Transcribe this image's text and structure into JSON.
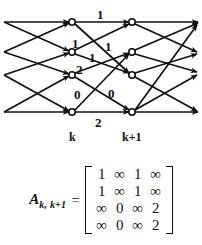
{
  "figure": {
    "type": "trellis-diagram-with-matrix",
    "stroke_color": "#111111",
    "background_color": "#ffffff"
  },
  "trellis": {
    "stage_labels": [
      {
        "text": "k",
        "x": 72,
        "y": 127
      },
      {
        "text": "k+1",
        "x": 132,
        "y": 127
      }
    ],
    "node_columns": [
      {
        "name": "stage-k",
        "x": 72
      },
      {
        "name": "stage-k1",
        "x": 132
      }
    ],
    "node_rows_y": [
      22,
      52,
      75,
      112
    ],
    "nodes": [
      {
        "id": "k-0",
        "col": 0,
        "row": 0,
        "x": 72,
        "y": 22
      },
      {
        "id": "k-1",
        "col": 0,
        "row": 1,
        "x": 72,
        "y": 52
      },
      {
        "id": "k-2",
        "col": 0,
        "row": 2,
        "x": 72,
        "y": 75
      },
      {
        "id": "k-3",
        "col": 0,
        "row": 3,
        "x": 72,
        "y": 112
      },
      {
        "id": "k1-0",
        "col": 1,
        "row": 0,
        "x": 132,
        "y": 22
      },
      {
        "id": "k1-1",
        "col": 1,
        "row": 1,
        "x": 132,
        "y": 52
      },
      {
        "id": "k1-2",
        "col": 1,
        "row": 2,
        "x": 132,
        "y": 75
      },
      {
        "id": "k1-3",
        "col": 1,
        "row": 3,
        "x": 132,
        "y": 112
      }
    ],
    "edge_labels": [
      {
        "id": "lbl-top-1",
        "text": "1",
        "x": 97,
        "y": 8
      },
      {
        "id": "lbl-mid-1a",
        "text": "1",
        "x": 72,
        "y": 37
      },
      {
        "id": "lbl-mid-1b",
        "text": "1",
        "x": 89,
        "y": 51
      },
      {
        "id": "lbl-mid-1c",
        "text": "1",
        "x": 105,
        "y": 40
      },
      {
        "id": "lbl-mid-2",
        "text": "2",
        "x": 76,
        "y": 63
      },
      {
        "id": "lbl-bot-0a",
        "text": "0",
        "x": 74,
        "y": 88
      },
      {
        "id": "lbl-bot-0b",
        "text": "0",
        "x": 108,
        "y": 87
      },
      {
        "id": "lbl-bot-2",
        "text": "2",
        "x": 95,
        "y": 116
      }
    ]
  },
  "matrix": {
    "name": "A",
    "subscript": "k, k+1",
    "equals": "=",
    "rows": [
      [
        "1",
        "∞",
        "1",
        "∞"
      ],
      [
        "1",
        "∞",
        "1",
        "∞"
      ],
      [
        "∞",
        "0",
        "∞",
        "2"
      ],
      [
        "∞",
        "0",
        "∞",
        "2"
      ]
    ]
  }
}
